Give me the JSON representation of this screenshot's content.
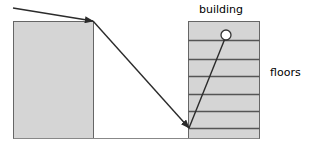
{
  "diagram": {
    "type": "ray-reflection-building-schematic",
    "canvas": {
      "width": 311,
      "height": 152,
      "background": "#ffffff"
    },
    "colors": {
      "shape_fill": "#d5d5d5",
      "shape_stroke": "#666666",
      "floor_line": "#555555",
      "base_line": "#888888",
      "ray": "#2b2b2b",
      "circle_fill": "#ffffff",
      "circle_stroke": "#333333",
      "label_text": "#000000"
    },
    "labels": {
      "building": "building",
      "floors": "floors"
    },
    "left_block": {
      "name": "left-obstacle-block",
      "x": 13,
      "y": 21,
      "width": 80,
      "height": 117
    },
    "building_block": {
      "name": "building-block",
      "x": 188,
      "y": 21,
      "width": 71,
      "height": 117,
      "floor_count": 7,
      "floor_divider_y": [
        40,
        59,
        76,
        94,
        111,
        128
      ]
    },
    "ground_line": {
      "name": "ground-baseline",
      "x1": 13,
      "y1": 138,
      "x2": 259,
      "y2": 138
    },
    "marker_circle": {
      "name": "receiver-node",
      "cx": 226,
      "cy": 35,
      "r": 5
    },
    "rays": [
      {
        "name": "incident-ray",
        "x1": 13,
        "y1": 8,
        "x2": 93,
        "y2": 21,
        "arrowhead": "end"
      },
      {
        "name": "diffracted-ray-down",
        "x1": 93,
        "y1": 21,
        "x2": 189,
        "y2": 128,
        "arrowhead": "end"
      },
      {
        "name": "reflected-ray-up",
        "x1": 189,
        "y1": 128,
        "x2": 226,
        "y2": 35,
        "arrowhead": "none"
      }
    ]
  }
}
